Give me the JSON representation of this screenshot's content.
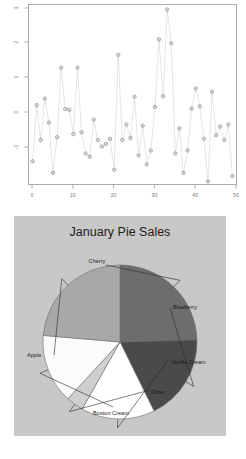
{
  "chart_data": [
    {
      "type": "scatter",
      "title": "",
      "xlabel": "",
      "ylabel": "",
      "xlim": [
        0,
        51
      ],
      "ylim": [
        -1.6,
        3.05
      ],
      "xticks": [
        0,
        10,
        20,
        30,
        40,
        50
      ],
      "yticks": [
        -1,
        0,
        1,
        2,
        3
      ],
      "ytick_labels": [
        "-1",
        "0",
        "1",
        "2",
        "3"
      ],
      "ytick_rotated": true,
      "grid": false,
      "legend": "none",
      "marker": "circle-dot",
      "line_color": "#cfcfcf",
      "marker_color": "#8c8c8c",
      "x": [
        1,
        2,
        3,
        4,
        5,
        6,
        7,
        8,
        9,
        10,
        11,
        12,
        13,
        14,
        15,
        16,
        17,
        18,
        19,
        20,
        21,
        22,
        23,
        24,
        25,
        26,
        27,
        28,
        29,
        30,
        31,
        32,
        33,
        34,
        35,
        36,
        37,
        38,
        39,
        40,
        41,
        42,
        43,
        44,
        45,
        46,
        47,
        48,
        49,
        50
      ],
      "y": [
        -1.0,
        0.45,
        -0.45,
        0.62,
        0.0,
        -1.3,
        -0.38,
        1.42,
        0.35,
        0.33,
        -0.3,
        1.42,
        -0.25,
        -0.8,
        -0.88,
        0.08,
        -0.45,
        -0.62,
        -0.55,
        -0.42,
        -1.22,
        1.75,
        -0.45,
        -0.05,
        -0.4,
        0.67,
        -0.85,
        -0.08,
        -1.08,
        -0.72,
        0.4,
        2.15,
        0.68,
        2.92,
        2.05,
        -0.8,
        -0.15,
        -1.3,
        -0.72,
        0.36,
        0.88,
        0.42,
        -0.42,
        -1.52,
        0.8,
        -0.33,
        -0.1,
        -0.45,
        -0.05,
        -1.38
      ]
    },
    {
      "type": "pie",
      "title": "January Pie Sales",
      "labels": [
        "Cherry",
        "Blueberry",
        "Vanilla Cream",
        "Other",
        "Boston Cream",
        "Apple"
      ],
      "values": [
        27,
        20,
        17,
        4,
        16,
        26
      ],
      "colors": [
        "#6d6d6d",
        "#4a4a4a",
        "#ffffff",
        "#cfcfcf",
        "#fbfbfb",
        "#a8a8a8"
      ],
      "start_angle_deg": -90,
      "direction": "clockwise",
      "legend": "leader-labels",
      "background": "#c8c8c8"
    }
  ],
  "pie": {
    "title": "January Pie Sales",
    "labels": {
      "cherry": "Cherry",
      "blueberry": "Blueberry",
      "vanilla_cream": "Vanilla Cream",
      "other": "Other",
      "boston_cream": "Boston Cream",
      "apple": "Apple"
    }
  },
  "scatter": {
    "xticks": [
      "0",
      "10",
      "20",
      "30",
      "40",
      "50"
    ],
    "yticks": [
      "3",
      "2",
      "1",
      "0",
      "-1"
    ]
  }
}
